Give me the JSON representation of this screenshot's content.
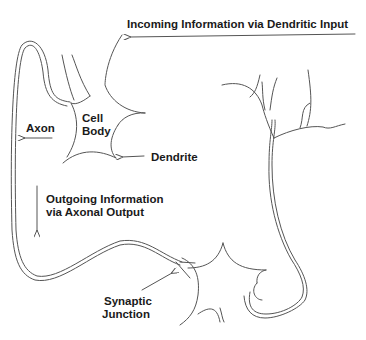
{
  "diagram": {
    "type": "neuron-signal-flow",
    "line_color": "#555555",
    "text_color": "#1a1a1a",
    "labels": {
      "incoming": "Incoming Information via Dendritic Input",
      "cell_body_line1": "Cell",
      "cell_body_line2": "Body",
      "axon": "Axon",
      "dendrite": "Dendrite",
      "outgoing_line1": "Outgoing Information",
      "outgoing_line2": "via Axonal Output",
      "synaptic_line1": "Synaptic",
      "synaptic_line2": "Junction"
    },
    "arrows": [
      {
        "id": "incoming-arrow",
        "direction": "left"
      },
      {
        "id": "axon-arrow",
        "direction": "left"
      },
      {
        "id": "dendrite-arrow",
        "direction": "left"
      },
      {
        "id": "outgoing-arrow",
        "direction": "down"
      },
      {
        "id": "synaptic-arrow",
        "direction": "up-right"
      }
    ]
  }
}
